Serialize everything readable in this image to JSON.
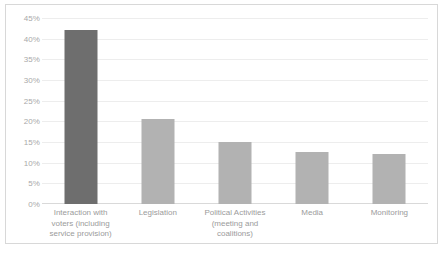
{
  "chart_data": {
    "type": "bar",
    "title": "",
    "subtitle": "",
    "xlabel": "",
    "ylabel": "",
    "grid": true,
    "legend": false,
    "legend_position": "none",
    "ylim": [
      0,
      45
    ],
    "ytick_step": 5,
    "ytick_labels": [
      "0%",
      "5%",
      "10%",
      "15%",
      "20%",
      "25%",
      "30%",
      "35%",
      "40%",
      "45%"
    ],
    "ytick_values": [
      0,
      5,
      10,
      15,
      20,
      25,
      30,
      35,
      40,
      45
    ],
    "categories": [
      "Interaction with\nvoters (including\nservice provision)",
      "Legislation",
      "Political Activities\n(meeting and\ncoalitions)",
      "Media",
      "Monitoring"
    ],
    "values": [
      42,
      20.5,
      15,
      12.5,
      12
    ],
    "value_labels": [
      "42%",
      "20.5%",
      "15%",
      "12.5%",
      "12%"
    ],
    "bar_colors": [
      "#6e6e6e",
      "#b2b2b2",
      "#b2b2b2",
      "#b2b2b2",
      "#b2b2b2"
    ]
  },
  "colors": {
    "bar_primary": "#6e6e6e",
    "bar_secondary": "#b2b2b2",
    "gridline": "#ededed",
    "axis_text": "#a9a9a9",
    "category_text": "#9b9b9b",
    "border": "#d8d8d8",
    "background": "#ffffff"
  }
}
